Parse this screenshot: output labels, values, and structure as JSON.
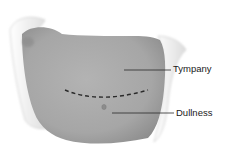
{
  "diagram": {
    "labels": [
      {
        "text": "Tympany",
        "region": "upper abdomen"
      },
      {
        "text": "Dullness",
        "region": "lower abdomen"
      }
    ],
    "boundary": "dashed-line",
    "colors": {
      "body": "#a9a9a9",
      "body_shadow": "#8f8f8f",
      "sheet": "#f2f2f2",
      "sheet_edge": "#cfcfcf",
      "line": "#2a2a2a"
    }
  }
}
